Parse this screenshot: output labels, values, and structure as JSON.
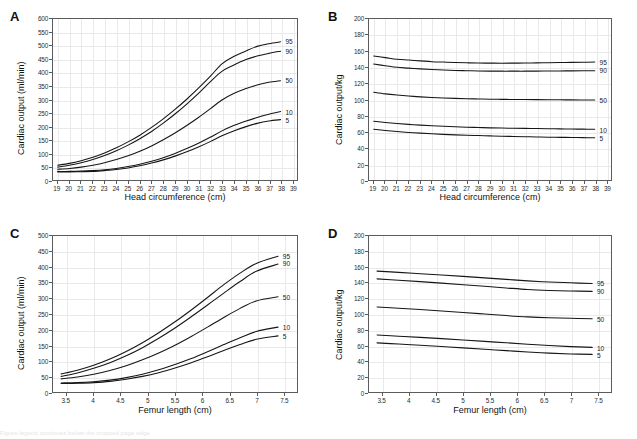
{
  "figure": {
    "background": "#ffffff",
    "curve_color": "#161616",
    "grid_color": "#e9e9ec",
    "axis_color": "#5b5b5b",
    "caption_partial": "Figure legend continues below the cropped page edge"
  },
  "panels": [
    {
      "letter": "A",
      "chart_data": {
        "type": "line",
        "title": "",
        "xlabel": "Head circumference (cm)",
        "ylabel": "Cardiac output (ml/min)",
        "xlim": [
          18.6,
          39.4
        ],
        "ylim": [
          0,
          600
        ],
        "xticks": [
          19,
          20,
          21,
          22,
          23,
          24,
          25,
          26,
          27,
          28,
          29,
          30,
          31,
          32,
          33,
          34,
          35,
          36,
          37,
          38,
          39
        ],
        "yticks": [
          0,
          50,
          100,
          150,
          200,
          250,
          300,
          350,
          400,
          450,
          500,
          550,
          600
        ],
        "grid": true,
        "legend_position": "right-endpoint-labels",
        "x": [
          19,
          20,
          21,
          22,
          23,
          24,
          25,
          26,
          27,
          28,
          29,
          30,
          31,
          32,
          33,
          34,
          35,
          36,
          37,
          38
        ],
        "series": [
          {
            "name": "95",
            "label": "95",
            "values": [
              55,
              62,
              72,
              85,
              101,
              120,
              142,
              167,
              196,
              228,
              263,
              301,
              342,
              386,
              433,
              460,
              480,
              498,
              508,
              515
            ]
          },
          {
            "name": "90",
            "label": "90",
            "values": [
              48,
              55,
              64,
              76,
              91,
              109,
              130,
              154,
              181,
              212,
              246,
              283,
              323,
              366,
              405,
              428,
              448,
              462,
              472,
              480
            ]
          },
          {
            "name": "50",
            "label": "50",
            "values": [
              40,
              43,
              48,
              55,
              64,
              76,
              90,
              107,
              127,
              150,
              175,
              203,
              233,
              265,
              298,
              322,
              340,
              354,
              364,
              370
            ]
          },
          {
            "name": "10",
            "label": "10",
            "values": [
              32,
              32,
              33,
              35,
              38,
              43,
              50,
              59,
              70,
              83,
              99,
              117,
              137,
              159,
              183,
              203,
              219,
              233,
              245,
              255
            ]
          },
          {
            "name": "5",
            "label": "5",
            "values": [
              30,
              30,
              31,
              32,
              35,
              39,
              45,
              53,
              63,
              75,
              89,
              105,
              123,
              143,
              165,
              183,
              198,
              211,
              220,
              225
            ]
          }
        ]
      }
    },
    {
      "letter": "B",
      "chart_data": {
        "type": "line",
        "title": "",
        "xlabel": "Head circumference (cm)",
        "ylabel": "Cardiac output/kg",
        "xlim": [
          18.6,
          39.4
        ],
        "ylim": [
          0,
          200
        ],
        "xticks": [
          19,
          20,
          21,
          22,
          23,
          24,
          25,
          26,
          27,
          28,
          29,
          30,
          31,
          32,
          33,
          34,
          35,
          36,
          37,
          38,
          39
        ],
        "yticks": [
          0,
          20,
          40,
          60,
          80,
          100,
          120,
          140,
          160,
          180,
          200
        ],
        "grid": true,
        "legend_position": "right-endpoint-labels",
        "x": [
          19,
          20,
          21,
          22,
          23,
          24,
          25,
          26,
          27,
          28,
          29,
          30,
          31,
          32,
          33,
          34,
          35,
          36,
          37,
          38
        ],
        "series": [
          {
            "name": "95",
            "label": "95",
            "values": [
              154,
              152,
              150,
              149,
              148,
              147,
              146.5,
              146,
              145.6,
              145.3,
              145.2,
              145.1,
              145.2,
              145.3,
              145.5,
              145.7,
              145.9,
              146.1,
              146.3,
              146.5
            ]
          },
          {
            "name": "90",
            "label": "90",
            "values": [
              144,
              142,
              140,
              139,
              138,
              137.2,
              136.6,
              136.1,
              135.8,
              135.5,
              135.3,
              135.2,
              135.2,
              135.2,
              135.3,
              135.4,
              135.5,
              135.6,
              135.7,
              135.8
            ]
          },
          {
            "name": "50",
            "label": "50",
            "values": [
              109,
              107,
              105.5,
              104.3,
              103.3,
              102.5,
              101.9,
              101.4,
              101,
              100.7,
              100.4,
              100.2,
              100,
              99.9,
              99.8,
              99.7,
              99.6,
              99.5,
              99.4,
              99.3
            ]
          },
          {
            "name": "10",
            "label": "10",
            "values": [
              73,
              71.5,
              70.2,
              69.1,
              68.2,
              67.4,
              66.7,
              66.1,
              65.6,
              65.2,
              64.8,
              64.5,
              64.3,
              64.1,
              63.9,
              63.7,
              63.5,
              63.3,
              63.2,
              63
            ]
          },
          {
            "name": "5",
            "label": "5",
            "values": [
              63,
              61.5,
              60.2,
              59.1,
              58.2,
              57.4,
              56.7,
              56.1,
              55.6,
              55.2,
              54.8,
              54.4,
              54.1,
              53.8,
              53.5,
              53.2,
              53,
              52.8,
              52.6,
              52.4
            ]
          }
        ]
      }
    },
    {
      "letter": "C",
      "chart_data": {
        "type": "line",
        "title": "",
        "xlabel": "Femur length (cm)",
        "ylabel": "Cardiac output (ml/min)",
        "xlim": [
          3.25,
          7.75
        ],
        "ylim": [
          0,
          500
        ],
        "xticks": [
          3.5,
          4,
          4.5,
          5,
          5.5,
          6,
          6.5,
          7,
          7.5
        ],
        "xticklabels": [
          "3.5",
          "4",
          "4.5",
          "5",
          "5.5",
          "6",
          "6.5",
          "7",
          "7.5"
        ],
        "yticks": [
          0,
          50,
          100,
          150,
          200,
          250,
          300,
          350,
          400,
          450,
          500
        ],
        "grid": true,
        "legend_position": "right-endpoint-labels",
        "x": [
          3.4,
          3.7,
          4,
          4.3,
          4.6,
          4.9,
          5.2,
          5.5,
          5.8,
          6.1,
          6.4,
          6.7,
          7,
          7.4
        ],
        "series": [
          {
            "name": "95",
            "label": "95",
            "values": [
              58,
              70,
              86,
              106,
              130,
              158,
              190,
              225,
              263,
              303,
              344,
              381,
              412,
              435
            ]
          },
          {
            "name": "90",
            "label": "90",
            "values": [
              50,
              61,
              76,
              94,
              116,
              142,
              172,
              205,
              241,
              279,
              317,
              354,
              387,
              410
            ]
          },
          {
            "name": "50",
            "label": "50",
            "values": [
              42,
              48,
              57,
              69,
              84,
              103,
              125,
              150,
              178,
              208,
              239,
              268,
              292,
              305
            ]
          },
          {
            "name": "10",
            "label": "10",
            "values": [
              29,
              30,
              33,
              38,
              46,
              57,
              71,
              88,
              107,
              129,
              152,
              174,
              194,
              208
            ]
          },
          {
            "name": "5",
            "label": "5",
            "values": [
              27,
              28,
              30,
              34,
              41,
              50,
              62,
              77,
              94,
              113,
              133,
              152,
              169,
              180
            ]
          }
        ]
      }
    },
    {
      "letter": "D",
      "chart_data": {
        "type": "line",
        "title": "",
        "xlabel": "Femur length (cm)",
        "ylabel": "Cardiac output/kg",
        "xlim": [
          3.25,
          7.75
        ],
        "ylim": [
          0,
          200
        ],
        "xticks": [
          3.5,
          4,
          4.5,
          5,
          5.5,
          6,
          6.5,
          7,
          7.5
        ],
        "xticklabels": [
          "3.5",
          "4",
          "4.5",
          "5",
          "5.5",
          "6",
          "6.5",
          "7",
          "7.5"
        ],
        "yticks": [
          0,
          20,
          40,
          60,
          80,
          100,
          120,
          140,
          160,
          180,
          200
        ],
        "grid": true,
        "legend_position": "right-endpoint-labels",
        "x": [
          3.4,
          3.8,
          4.2,
          4.6,
          5,
          5.4,
          5.8,
          6.2,
          6.6,
          7,
          7.4
        ],
        "series": [
          {
            "name": "95",
            "label": "95",
            "values": [
              155,
              153.4,
              151.7,
              150,
              148.2,
              146.3,
              144.4,
              142.5,
              141,
              140,
              139
            ]
          },
          {
            "name": "90",
            "label": "90",
            "values": [
              145,
              143.3,
              141.5,
              139.6,
              137.6,
              135.5,
              133.4,
              131.4,
              130.2,
              129.5,
              129
            ]
          },
          {
            "name": "50",
            "label": "50",
            "values": [
              109,
              107.4,
              105.7,
              103.9,
              102,
              100,
              98,
              96.3,
              95.2,
              94.5,
              94
            ]
          },
          {
            "name": "10",
            "label": "10",
            "values": [
              73,
              71.5,
              70,
              68.4,
              66.7,
              64.9,
              63.1,
              61.3,
              59.6,
              58.2,
              57.2
            ]
          },
          {
            "name": "5",
            "label": "5",
            "values": [
              63,
              61.5,
              60,
              58.3,
              56.6,
              54.8,
              53,
              51.2,
              49.8,
              48.8,
              48.2
            ]
          }
        ]
      }
    }
  ]
}
